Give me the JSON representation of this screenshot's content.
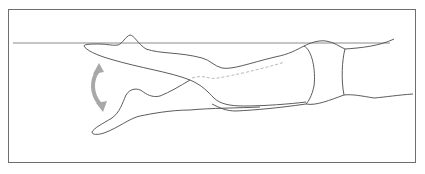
{
  "figure": {
    "colors": {
      "frame": "#6e6e6e",
      "outline": "#4a4a4a",
      "water_line": "#8a8a8a",
      "dashed_line": "#b0b0b0",
      "arrow": "#a8a8a8",
      "background": "#ffffff"
    },
    "elements": {
      "water_line": "water-surface-line",
      "arrow": "up-down-motion-arrow",
      "upper_foot": "leg-upper-position",
      "lower_foot": "leg-lower-position",
      "hip": "hip-band",
      "torso": "torso-outline"
    }
  }
}
